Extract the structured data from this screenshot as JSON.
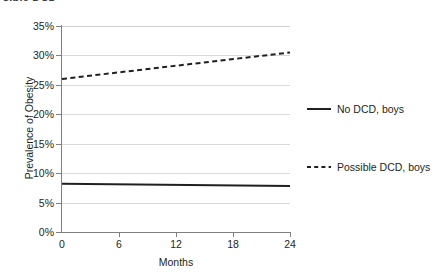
{
  "clipped_caption": "sible  DCD",
  "chart_data": {
    "type": "line",
    "title": "",
    "xlabel": "Months",
    "ylabel": "Prevalence of Obesity",
    "x": [
      0,
      6,
      12,
      18,
      24
    ],
    "xtick_labels": [
      "0",
      "6",
      "12",
      "18",
      "24"
    ],
    "xlim": [
      0,
      24
    ],
    "ytick_labels": [
      "0%",
      "5%",
      "10%",
      "15%",
      "20%",
      "25%",
      "30%",
      "35%"
    ],
    "ytick_values": [
      0,
      5,
      10,
      15,
      20,
      25,
      30,
      35
    ],
    "ylim": [
      0,
      35
    ],
    "grid": "horizontal",
    "legend_position": "right",
    "series": [
      {
        "name": "No DCD, boys",
        "style": "solid",
        "color": "#231f20",
        "width": 2.0,
        "x": [
          0,
          24
        ],
        "values": [
          8.2,
          7.8
        ]
      },
      {
        "name": "Possible DCD, boys",
        "style": "dashed",
        "color": "#231f20",
        "width": 2.0,
        "x": [
          0,
          24
        ],
        "values": [
          26.0,
          30.5
        ]
      }
    ]
  },
  "legend": {
    "entries": [
      {
        "label": "No DCD, boys",
        "style": "solid"
      },
      {
        "label": "Possible DCD, boys",
        "style": "dashed"
      }
    ]
  },
  "colors": {
    "background": "#ffffff",
    "axis": "#808080",
    "gridline": "#d9d9d9",
    "text": "#231f20",
    "series": "#231f20"
  }
}
